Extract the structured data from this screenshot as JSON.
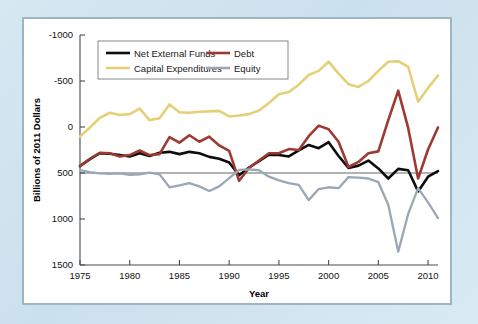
{
  "figure": {
    "background_color": "#cfe3ef",
    "panel_color": "#ffffff",
    "frame_color": "#9fb5c4"
  },
  "chart_data": {
    "type": "line",
    "title": "",
    "xlabel": "Year",
    "ylabel": "Billions of 2011 Dollars",
    "xlim": [
      1975,
      2011
    ],
    "ylim": [
      -1000,
      1500
    ],
    "xticks": [
      1975,
      1980,
      1985,
      1990,
      1995,
      2000,
      2005,
      2010
    ],
    "yticks": [
      -1000,
      -500,
      0,
      500,
      1000,
      1500
    ],
    "grid": false,
    "legend_position": "upper-left",
    "zero_line": true,
    "x": [
      1975,
      1976,
      1977,
      1978,
      1979,
      1980,
      1981,
      1982,
      1983,
      1984,
      1985,
      1986,
      1987,
      1988,
      1989,
      1990,
      1991,
      1992,
      1993,
      1994,
      1995,
      1996,
      1997,
      1998,
      1999,
      2000,
      2001,
      2002,
      2003,
      2004,
      2005,
      2006,
      2007,
      2008,
      2009,
      2010,
      2011
    ],
    "series": [
      {
        "name": "Net External Funds",
        "color": "#0d0d0d",
        "width": 2.6,
        "values": [
          75,
          150,
          215,
          210,
          195,
          180,
          215,
          185,
          220,
          230,
          205,
          230,
          215,
          175,
          155,
          115,
          -25,
          60,
          130,
          200,
          195,
          180,
          245,
          305,
          270,
          335,
          185,
          55,
          80,
          135,
          50,
          -60,
          45,
          30,
          -200,
          -40,
          20
        ]
      },
      {
        "name": "Debt",
        "color": "#9d3a31",
        "width": 2.6,
        "values": [
          78,
          155,
          220,
          215,
          180,
          195,
          245,
          195,
          205,
          390,
          330,
          410,
          340,
          395,
          300,
          240,
          -85,
          55,
          135,
          215,
          215,
          260,
          250,
          400,
          515,
          475,
          340,
          65,
          120,
          215,
          235,
          575,
          895,
          490,
          -60,
          255,
          495
        ]
      },
      {
        "name": "Capital Expenditures",
        "color": "#e5d077",
        "width": 2.6,
        "values": [
          395,
          495,
          600,
          655,
          630,
          640,
          700,
          575,
          595,
          745,
          660,
          655,
          665,
          670,
          675,
          615,
          625,
          640,
          680,
          760,
          855,
          880,
          960,
          1065,
          1110,
          1210,
          1080,
          965,
          935,
          1000,
          1110,
          1210,
          1215,
          1155,
          775,
          925,
          1060
        ]
      },
      {
        "name": "Equity",
        "color": "#9aa7b5",
        "width": 2.3,
        "values": [
          30,
          10,
          -5,
          -10,
          -5,
          -20,
          -15,
          5,
          -15,
          -155,
          -135,
          -110,
          -145,
          -195,
          -145,
          -55,
          35,
          40,
          30,
          -40,
          -80,
          -110,
          -130,
          -295,
          -175,
          -155,
          -165,
          -45,
          -50,
          -60,
          -100,
          -345,
          -855,
          -445,
          -165,
          -320,
          -490
        ]
      }
    ]
  },
  "legend": {
    "entries": [
      {
        "label": "Net External Funds",
        "color": "#0d0d0d"
      },
      {
        "label": "Debt",
        "color": "#9d3a31"
      },
      {
        "label": "Capital Expenditures",
        "color": "#e5d077"
      },
      {
        "label": "Equity",
        "color": "#9aa7b5"
      }
    ]
  },
  "axes": {
    "y_tick_labels": [
      "1500",
      "1000",
      "500",
      "0",
      "-500",
      "-1000"
    ],
    "x_tick_labels": [
      "1975",
      "1980",
      "1985",
      "1990",
      "1995",
      "2000",
      "2005",
      "2010"
    ],
    "x_axis_title": "Year",
    "y_axis_title": "Billions of 2011 Dollars"
  }
}
